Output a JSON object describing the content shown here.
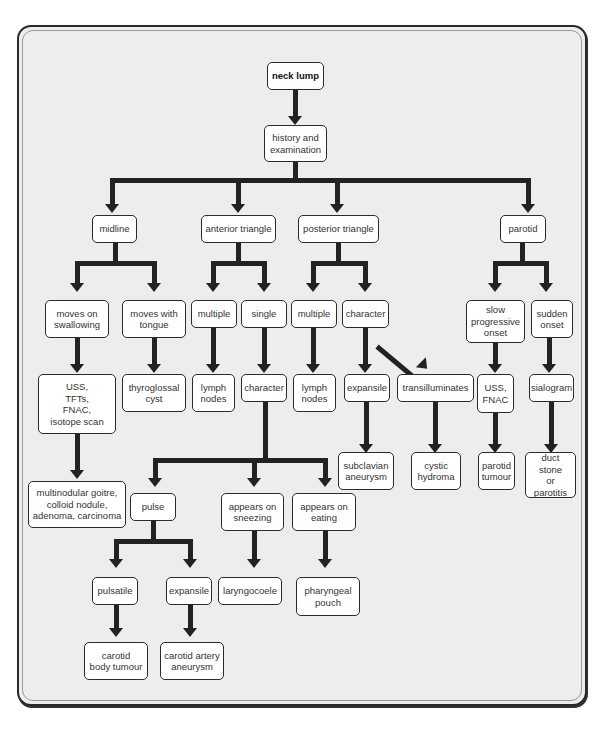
{
  "diagram": {
    "type": "flowchart",
    "title_node": "neck lump",
    "nodes": {
      "neck_lump": "neck lump",
      "history": "history and\nexamination",
      "midline": "midline",
      "anterior": "anterior triangle",
      "posterior": "posterior triangle",
      "parotid": "parotid",
      "moves_swallowing": "moves on\nswallowing",
      "moves_tongue": "moves with\ntongue",
      "ant_multiple": "multiple",
      "ant_single": "single",
      "post_multiple": "multiple",
      "post_character": "character",
      "slow_onset": "slow\nprogressive\nonset",
      "sudden_onset": "sudden\nonset",
      "uss_tfts": "USS,\nTFTs,\nFNAC,\nisotope scan",
      "thyroglossal": "thyroglossal\ncyst",
      "ant_lymph": "lymph\nnodes",
      "ant_character": "character",
      "post_lymph": "lymph\nnodes",
      "expansile_post": "expansile",
      "transilluminates": "transilluminates",
      "uss_fnac": "USS,\nFNAC",
      "sialogram": "sialogram",
      "subclavian": "subclavian\naneurysm",
      "cystic_hydroma": "cystic\nhydroma",
      "parotid_tumour": "parotid\ntumour",
      "duct_stone": "duct stone\nor\nparotitis",
      "multinodular": "multinodular goitre,\ncolloid nodule,\nadenoma, carcinoma",
      "pulse": "pulse",
      "appears_sneezing": "appears on\nsneezing",
      "appears_eating": "appears on\neating",
      "pulsatile": "pulsatile",
      "expansile_ant": "expansile",
      "laryngocoele": "laryngocoele",
      "pharyngeal_pouch": "pharyngeal\npouch",
      "carotid_body": "carotid\nbody tumour",
      "carotid_aneurysm": "carotid artery\naneurysm"
    },
    "edges": [
      [
        "neck_lump",
        "history"
      ],
      [
        "history",
        "midline"
      ],
      [
        "history",
        "anterior"
      ],
      [
        "history",
        "posterior"
      ],
      [
        "history",
        "parotid"
      ],
      [
        "midline",
        "moves_swallowing"
      ],
      [
        "midline",
        "moves_tongue"
      ],
      [
        "anterior",
        "ant_multiple"
      ],
      [
        "anterior",
        "ant_single"
      ],
      [
        "posterior",
        "post_multiple"
      ],
      [
        "posterior",
        "post_character"
      ],
      [
        "parotid",
        "slow_onset"
      ],
      [
        "parotid",
        "sudden_onset"
      ],
      [
        "moves_swallowing",
        "uss_tfts"
      ],
      [
        "moves_tongue",
        "thyroglossal"
      ],
      [
        "ant_multiple",
        "ant_lymph"
      ],
      [
        "ant_single",
        "ant_character"
      ],
      [
        "post_multiple",
        "post_lymph"
      ],
      [
        "post_character",
        "expansile_post"
      ],
      [
        "post_character",
        "transilluminates"
      ],
      [
        "slow_onset",
        "uss_fnac"
      ],
      [
        "sudden_onset",
        "sialogram"
      ],
      [
        "uss_tfts",
        "multinodular"
      ],
      [
        "expansile_post",
        "subclavian"
      ],
      [
        "transilluminates",
        "cystic_hydroma"
      ],
      [
        "uss_fnac",
        "parotid_tumour"
      ],
      [
        "sialogram",
        "duct_stone"
      ],
      [
        "ant_character",
        "pulse"
      ],
      [
        "ant_character",
        "appears_sneezing"
      ],
      [
        "ant_character",
        "appears_eating"
      ],
      [
        "pulse",
        "pulsatile"
      ],
      [
        "pulse",
        "expansile_ant"
      ],
      [
        "appears_sneezing",
        "laryngocoele"
      ],
      [
        "appears_eating",
        "pharyngeal_pouch"
      ],
      [
        "pulsatile",
        "carotid_body"
      ],
      [
        "expansile_ant",
        "carotid_aneurysm"
      ]
    ]
  },
  "colors": {
    "frame_fill": "#ededed",
    "node_fill": "#ffffff",
    "connector": "#222222"
  }
}
